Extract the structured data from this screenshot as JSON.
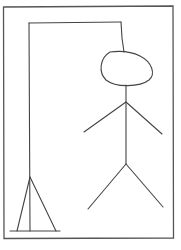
{
  "drawing": {
    "subject": "hangman",
    "stroke_color": "#444444",
    "frame_color": "#555555",
    "background": "#ffffff",
    "parts": [
      "frame",
      "gallows-post",
      "gallows-beam",
      "rope",
      "head",
      "body",
      "left-arm",
      "right-arm",
      "left-leg",
      "right-leg",
      "gallows-base"
    ]
  }
}
